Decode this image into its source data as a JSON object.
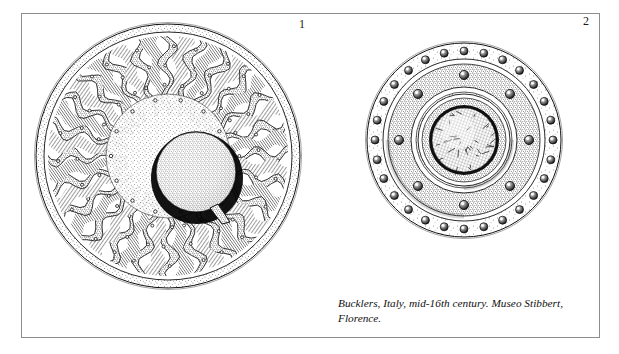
{
  "page": {
    "background_color": "#ffffff",
    "frame_color": "#8d8d8d",
    "ink_color": "#111111"
  },
  "figures": [
    {
      "number": "1",
      "label": "buckler-radiating-flame-ribs",
      "center": [
        168,
        156
      ],
      "radius": 132,
      "boss_center": [
        196,
        172
      ],
      "boss_radius": 40,
      "rib_count": 24,
      "description": "Circular steel buckler with radiating wavy flame-shaped ribs, stippled rim band and domed central boss with rivet tab"
    },
    {
      "number": "2",
      "label": "buckler-concentric-studded",
      "center": [
        464,
        140
      ],
      "radius": 97,
      "boss_center": [
        464,
        140
      ],
      "boss_radius": 32,
      "rim_stud_count": 28,
      "inner_stud_count": 8,
      "description": "Circular steel buckler with concentric stippled bands, ring of rim studs and textured central boss"
    }
  ],
  "caption": {
    "text": "Bucklers, Italy, mid-16th century. Museo Stibbert, Florence."
  }
}
